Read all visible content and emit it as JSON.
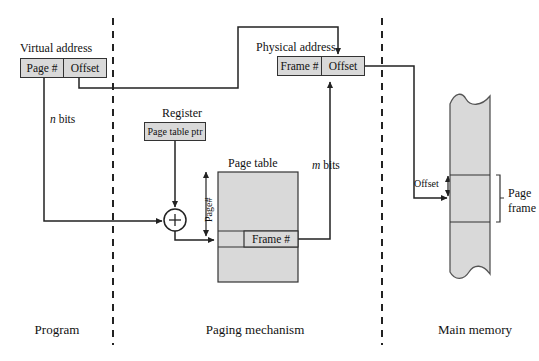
{
  "figure": {
    "sections": [
      {
        "name": "program",
        "label": "Program"
      },
      {
        "name": "paging-mechanism",
        "label": "Paging mechanism"
      },
      {
        "name": "main-memory",
        "label": "Main memory"
      }
    ]
  },
  "virtual_address": {
    "title": "Virtual address",
    "fields": [
      {
        "name": "page-number",
        "label": "Page #"
      },
      {
        "name": "offset",
        "label": "Offset"
      }
    ]
  },
  "physical_address": {
    "title": "Physical address",
    "fields": [
      {
        "name": "frame-number",
        "label": "Frame #"
      },
      {
        "name": "offset",
        "label": "Offset"
      }
    ]
  },
  "register": {
    "title": "Register",
    "value": "Page table ptr"
  },
  "page_table": {
    "title": "Page table",
    "index_label": "Page#",
    "entry_label": "Frame #"
  },
  "memory": {
    "offset_label": "Offset",
    "page_frame_label": "Page\nframe",
    "page_frame_label_line1": "Page",
    "page_frame_label_line2": "frame"
  },
  "annotations": {
    "n_bits_italic": "n",
    "n_bits_rest": " bits",
    "m_bits_italic": "m",
    "m_bits_rest": " bits",
    "adder_symbol": "+"
  },
  "colors": {
    "fill_gray": "#d9d9d9",
    "stroke": "#333333",
    "text": "#111111",
    "background": "#ffffff"
  }
}
